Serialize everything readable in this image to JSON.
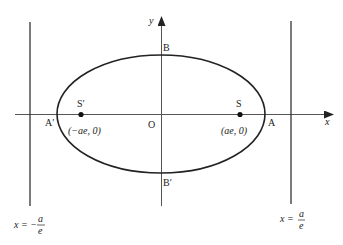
{
  "diagram": {
    "title": "",
    "type": "ellipse with foci and directrices",
    "colors": {
      "stroke": "#222222",
      "axis": "#555555",
      "background": "#ffffff"
    },
    "axes": {
      "x_label": "x",
      "y_label": "y",
      "origin_label": "O"
    },
    "vertices": {
      "A": "A",
      "A_prime": "A′",
      "B": "B",
      "B_prime": "B′"
    },
    "foci": {
      "S": {
        "label": "S",
        "coord": "(ae, 0)"
      },
      "S_prime": {
        "label": "S′",
        "coord": "(−ae, 0)"
      }
    },
    "directrices": {
      "left": {
        "lhs": "x = −",
        "num": "a",
        "den": "e"
      },
      "right": {
        "lhs": "x =",
        "num": "a",
        "den": "e"
      }
    }
  }
}
